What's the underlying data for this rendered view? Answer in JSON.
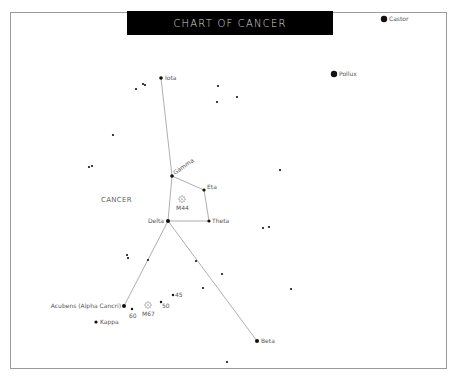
{
  "title": "CHART OF CANCER",
  "constellation_label": "CANCER",
  "colors": {
    "background": "#ffffff",
    "title_bg": "#000000",
    "title_text": "#d8d8d8",
    "line": "#9a9a9a",
    "star": "#111111",
    "label": "#555555"
  },
  "named_stars": [
    {
      "id": "castor",
      "label": "Castor",
      "x": 384,
      "y": 19,
      "r": 3.2
    },
    {
      "id": "pollux",
      "label": "Pollux",
      "x": 334,
      "y": 74,
      "r": 3.2
    },
    {
      "id": "iota",
      "label": "Iota",
      "x": 161,
      "y": 78,
      "r": 1.8
    },
    {
      "id": "gamma",
      "label": "Gamma",
      "x": 172,
      "y": 176,
      "r": 1.8
    },
    {
      "id": "eta",
      "label": "Eta",
      "x": 204,
      "y": 190,
      "r": 1.6
    },
    {
      "id": "delta",
      "label": "Delta",
      "x": 168,
      "y": 221,
      "r": 2
    },
    {
      "id": "theta",
      "label": "Theta",
      "x": 209,
      "y": 221,
      "r": 1.6
    },
    {
      "id": "acubens",
      "label": "Acubens (Alpha Cancri)",
      "x": 124,
      "y": 306,
      "r": 2
    },
    {
      "id": "kappa",
      "label": "Kappa",
      "x": 96,
      "y": 322,
      "r": 1.6
    },
    {
      "id": "beta",
      "label": "Beta",
      "x": 257,
      "y": 341,
      "r": 2
    },
    {
      "id": "s60",
      "label": "60",
      "x": 132,
      "y": 309,
      "r": 1.2
    },
    {
      "id": "s50",
      "label": "50",
      "x": 161,
      "y": 302,
      "r": 1.2
    },
    {
      "id": "s45",
      "label": "45",
      "x": 173,
      "y": 295,
      "r": 1.2
    }
  ],
  "clusters": [
    {
      "id": "m44",
      "label": "M44",
      "x": 182,
      "y": 199
    },
    {
      "id": "m67",
      "label": "M67",
      "x": 148,
      "y": 305
    }
  ],
  "field_stars": [
    [
      136,
      89
    ],
    [
      143,
      84
    ],
    [
      145,
      85
    ],
    [
      218,
      86
    ],
    [
      237,
      97
    ],
    [
      217,
      102
    ],
    [
      113,
      135
    ],
    [
      89,
      167
    ],
    [
      92,
      166
    ],
    [
      280,
      170
    ],
    [
      263,
      228
    ],
    [
      269,
      227
    ],
    [
      127,
      255
    ],
    [
      128,
      258
    ],
    [
      148,
      260
    ],
    [
      196,
      261
    ],
    [
      222,
      274
    ],
    [
      203,
      288
    ],
    [
      291,
      289
    ],
    [
      227,
      362
    ]
  ],
  "lines": [
    [
      "iota",
      "gamma"
    ],
    [
      "gamma",
      "delta"
    ],
    [
      "gamma",
      "eta"
    ],
    [
      "eta",
      "theta"
    ],
    [
      "delta",
      "theta"
    ],
    [
      "delta",
      "acubens"
    ],
    [
      "delta",
      "beta"
    ]
  ]
}
